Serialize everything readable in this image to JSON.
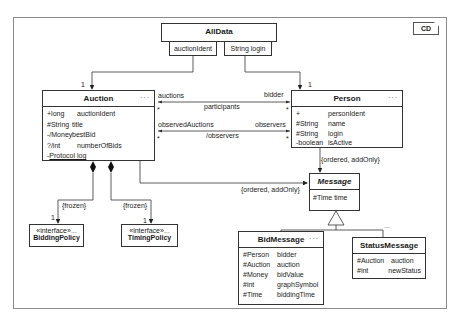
{
  "diagram_tag": "CD",
  "alldata": {
    "name": "AllData",
    "qualifiers": [
      "auctionIdent",
      "String login"
    ]
  },
  "auction": {
    "name": "Auction",
    "more": "...",
    "attributes": [
      {
        "type": "+long",
        "name": "auctionIdent"
      },
      {
        "type": "#String",
        "name": "title"
      },
      {
        "type": "-/Money",
        "name": "bestBid"
      },
      {
        "type": "?/int",
        "name": "numberOfBids"
      },
      {
        "type": "-",
        "name": "Protocol log"
      }
    ]
  },
  "person": {
    "name": "Person",
    "more": "...",
    "attributes": [
      {
        "type": "+",
        "name": "personIdent"
      },
      {
        "type": "#String",
        "name": "name"
      },
      {
        "type": "#String",
        "name": "login"
      },
      {
        "type": "-boolean",
        "name": "isActive"
      }
    ]
  },
  "message": {
    "name": "Message",
    "attributes": [
      {
        "type": "#Time",
        "name": "time"
      }
    ]
  },
  "bidmessage": {
    "name": "BidMessage",
    "more": "...",
    "attributes": [
      {
        "type": "#Person",
        "name": "bidder"
      },
      {
        "type": "#Auction",
        "name": "auction"
      },
      {
        "type": "#Money",
        "name": "bidValue"
      },
      {
        "type": "#int",
        "name": "graphSymbol"
      },
      {
        "type": "#Time",
        "name": "biddingTime"
      }
    ]
  },
  "statusmessage": {
    "name": "StatusMessage",
    "more": "...",
    "attributes": [
      {
        "type": "#Auction",
        "name": "auction"
      },
      {
        "type": "#int",
        "name": "newStatus"
      }
    ]
  },
  "biddingpolicy": {
    "stereotype": "«interface»",
    "name": "BiddingPolicy",
    "more": "..."
  },
  "timingpolicy": {
    "stereotype": "«interface»",
    "name": "TimingPolicy",
    "more": "..."
  },
  "labels": {
    "mult_auction_top": "1",
    "mult_person_top": "1",
    "auctions": "auctions",
    "bidder": "bidder",
    "participants": "participants",
    "star1": "*",
    "star2": "*",
    "observedAuctions": "observedAuctions",
    "observers": "observers",
    "derived_observers": "/observers",
    "star3": "*",
    "star4": "*",
    "person_msg_constraint": "{ordered, addOnly}",
    "auction_msg_constraint": "{ordered, addOnly}",
    "frozen1": "{frozen}",
    "frozen2": "{frozen}",
    "mult_bp": "1",
    "mult_tp": "1"
  }
}
